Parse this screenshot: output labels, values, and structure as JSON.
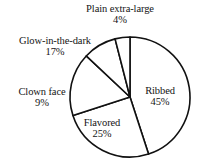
{
  "chart_data": {
    "type": "pie",
    "title": "",
    "subtitle": "",
    "xlabel": "",
    "ylabel": "",
    "grid": false,
    "legend_position": "none",
    "labels_position": "around-and-inside-slices",
    "units": "percent",
    "total": 100,
    "categories": [
      "Ribbed",
      "Flavored",
      "Glow-in-the-dark",
      "Clown face",
      "Plain extra-large"
    ],
    "values": [
      45,
      25,
      17,
      9,
      4
    ],
    "slices": [
      {
        "name": "Ribbed",
        "label": "Ribbed",
        "percent_label": "45%",
        "value": 45,
        "fill": "#ffffff",
        "stroke": "#111111",
        "label_placement": "inside"
      },
      {
        "name": "Flavored",
        "label": "Flavored",
        "percent_label": "25%",
        "value": 25,
        "fill": "#ffffff",
        "stroke": "#111111",
        "label_placement": "inside"
      },
      {
        "name": "Clown face",
        "label": "Clown face",
        "percent_label": "9%",
        "value": 9,
        "fill": "#ffffff",
        "stroke": "#111111",
        "label_placement": "outside-left"
      },
      {
        "name": "Glow-in-the-dark",
        "label": "Glow-in-the-dark",
        "percent_label": "17%",
        "value": 17,
        "fill": "#ffffff",
        "stroke": "#111111",
        "label_placement": "outside-upper-left"
      },
      {
        "name": "Plain extra-large",
        "label": "Plain extra-large",
        "percent_label": "4%",
        "value": 4,
        "fill": "#ffffff",
        "stroke": "#111111",
        "label_placement": "outside-top"
      }
    ],
    "geometry": {
      "center_x": 130,
      "center_y": 97,
      "radius": 60,
      "start_angle_deg": -90,
      "direction": "clockwise"
    },
    "colors": {
      "slice_fill": "#ffffff",
      "slice_stroke": "#111111",
      "text": "#141414",
      "background": "#ffffff"
    }
  }
}
